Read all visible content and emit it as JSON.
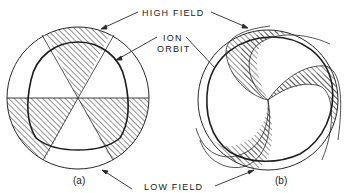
{
  "labels": {
    "high_field": "HIGH FIELD",
    "ion_line1": "ION",
    "ion_line2": "ORBIT",
    "low_field": "LOW FIELD"
  },
  "captions": {
    "a": "(a)",
    "b": "(b)"
  },
  "colors": {
    "stroke": "#2a2a2a",
    "hatch": "#3a3a3a",
    "background": "#ffffff"
  }
}
